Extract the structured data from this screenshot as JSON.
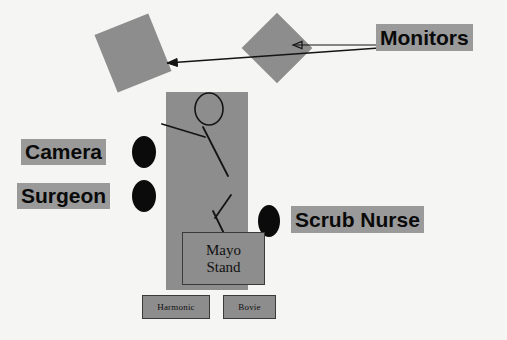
{
  "diagram": {
    "background_color": "#f5f5f3",
    "shape_fill_color": "#8d8d8d",
    "label_background_color": "#9a9a9a",
    "person_color": "#0b0b0b",
    "line_color": "#141414"
  },
  "labels": {
    "monitors": "Monitors",
    "camera": "Camera",
    "surgeon": "Surgeon",
    "scrub_nurse": "Scrub Nurse"
  },
  "equipment": {
    "mayo_stand_line1": "Mayo",
    "mayo_stand_line2": "Stand",
    "harmonic": "Harmonic",
    "bovie": "Bovie"
  },
  "shapes": {
    "monitor_left_name": "monitor-left",
    "monitor_right_name": "monitor-right",
    "operating_table_name": "operating-table",
    "patient_name": "patient-stick-figure"
  }
}
